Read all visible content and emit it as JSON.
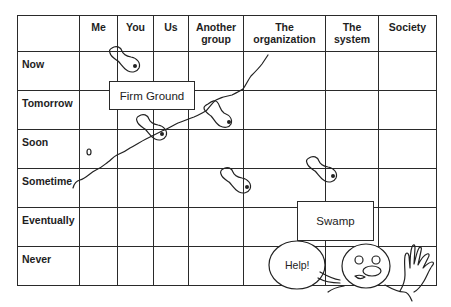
{
  "diagram": {
    "columns": [
      "",
      "Me",
      "You",
      "Us",
      "Another group",
      "The organization",
      "The system",
      "Society"
    ],
    "column_lines": [
      "Another",
      "group",
      "The",
      "organization",
      "The",
      "system"
    ],
    "rows": [
      "Now",
      "Tomorrow",
      "Soon",
      "Sometime",
      "Eventually",
      "Never"
    ],
    "labels": {
      "firm_ground": "Firm Ground",
      "swamp": "Swamp",
      "help": "Help!"
    },
    "colors": {
      "line": "#2a2a2a",
      "background": "#ffffff",
      "text": "#1e1e1e"
    }
  }
}
